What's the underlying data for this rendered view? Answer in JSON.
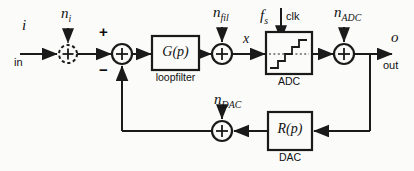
{
  "figure": {
    "kind": "block-diagram",
    "title": "",
    "background_color": "#fbfbfa",
    "line_color": "#1a1a1a",
    "text_color": "#111111"
  },
  "signals": {
    "input_symbol": "i",
    "input_name": "in",
    "output_symbol": "o",
    "output_name": "out",
    "intermediate_symbol": "x"
  },
  "noise_sources": [
    {
      "id": "n-i",
      "base": "n",
      "subscript": "i",
      "style": "dashed",
      "x": 63,
      "y": 8
    },
    {
      "id": "n-fil",
      "base": "n",
      "subscript": "fil",
      "style": "solid",
      "x": 215,
      "y": 8
    },
    {
      "id": "n-adc",
      "base": "n",
      "subscript": "ADC",
      "style": "solid",
      "x": 337,
      "y": 8
    },
    {
      "id": "n-dac",
      "base": "n",
      "subscript": "DAC",
      "style": "solid",
      "x": 216,
      "y": 95
    }
  ],
  "clock": {
    "rate_symbol": "f",
    "rate_subscript": "s",
    "label": "clk"
  },
  "blocks": [
    {
      "id": "loopfilter",
      "transfer": "G(p)",
      "caption": "loopfilter",
      "x": 152,
      "y": 36,
      "w": 47,
      "h": 34
    },
    {
      "id": "adc",
      "transfer": "",
      "caption": "ADC",
      "x": 266,
      "y": 32,
      "w": 46,
      "h": 42,
      "glyph": "staircase-quantizer"
    },
    {
      "id": "dac",
      "transfer": "R(p)",
      "caption": "DAC",
      "x": 268,
      "y": 112,
      "w": 44,
      "h": 38
    }
  ],
  "summers": [
    {
      "id": "sum-input",
      "style": "dashed",
      "cx": 68,
      "cy": 54,
      "r": 9,
      "signs": []
    },
    {
      "id": "sum-error",
      "style": "solid",
      "cx": 122,
      "cy": 54,
      "r": 10,
      "signs": [
        {
          "text": "+",
          "x": 101,
          "y": 30
        },
        {
          "text": "−",
          "x": 101,
          "y": 66
        }
      ]
    },
    {
      "id": "sum-filter-noise",
      "style": "solid",
      "cx": 222,
      "cy": 54,
      "r": 10,
      "signs": []
    },
    {
      "id": "sum-adc-noise",
      "style": "solid",
      "cx": 344,
      "cy": 54,
      "r": 10,
      "signs": []
    },
    {
      "id": "sum-dac-noise",
      "style": "solid",
      "cx": 222,
      "cy": 131,
      "r": 10,
      "signs": []
    }
  ],
  "labels": {
    "input_symbol_pos": {
      "x": 22,
      "y": 26
    },
    "input_name_pos": {
      "x": 16,
      "y": 58
    },
    "output_symbol_pos": {
      "x": 390,
      "y": 36
    },
    "output_name_pos": {
      "x": 385,
      "y": 62
    },
    "x_pos": {
      "x": 243,
      "y": 35
    },
    "fs_pos": {
      "x": 260,
      "y": 10
    },
    "clk_pos": {
      "x": 285,
      "y": 12
    }
  }
}
